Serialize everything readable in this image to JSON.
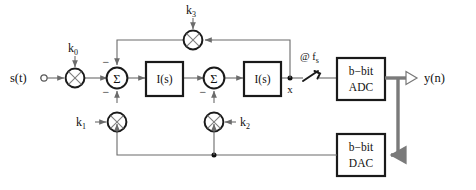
{
  "diagram": {
    "input_signal": {
      "label": "s(t)",
      "terminal": "input-terminal-circle"
    },
    "output_signal": {
      "label": "y(n)",
      "arrow": "open-arrowhead"
    },
    "node_labels": {
      "integrator_output": "x"
    },
    "clock": {
      "label_prefix": "@",
      "label_symbol": "f",
      "label_subscript": "s",
      "full": "@ fs"
    },
    "gains": [
      {
        "id": "k0",
        "base": "k",
        "subscript": "0",
        "position": "input-path",
        "symbol": "multiplier-cross-circle"
      },
      {
        "id": "k1",
        "base": "k",
        "subscript": "1",
        "position": "first-summer-feedback",
        "symbol": "multiplier-cross-circle"
      },
      {
        "id": "k2",
        "base": "k",
        "subscript": "2",
        "position": "second-summer-feedback",
        "symbol": "multiplier-cross-circle"
      },
      {
        "id": "k3",
        "base": "k",
        "subscript": "3",
        "position": "top-feedforward-path",
        "symbol": "multiplier-cross-circle"
      }
    ],
    "summers": [
      {
        "id": "sum1",
        "label": "Σ",
        "signs": [
          "−",
          "−"
        ]
      },
      {
        "id": "sum2",
        "label": "Σ",
        "signs": [
          "−"
        ]
      }
    ],
    "blocks": [
      {
        "id": "integrator1",
        "label": "I(s)"
      },
      {
        "id": "integrator2",
        "label": "I(s)"
      },
      {
        "id": "adc",
        "line1": "b−bit",
        "line2": "ADC"
      },
      {
        "id": "dac",
        "line1": "b−bit",
        "line2": "DAC"
      }
    ],
    "switch": {
      "id": "sampler",
      "type": "sampling-switch"
    },
    "colors": {
      "wire": "#6b6b6b",
      "block_outline": "#1a1a1a",
      "text": "#111111",
      "background": "#ffffff"
    }
  }
}
